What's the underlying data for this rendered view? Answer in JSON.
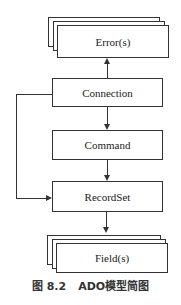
{
  "diagram": {
    "nodes": {
      "errors": {
        "label": "Error(s)",
        "stacked": true
      },
      "connection": {
        "label": "Connection"
      },
      "command": {
        "label": "Command"
      },
      "recordset": {
        "label": "RecordSet"
      },
      "fields": {
        "label": "Field(s)",
        "stacked": true
      }
    },
    "edges": [
      {
        "from": "Connection",
        "to": "Error(s)"
      },
      {
        "from": "Connection",
        "to": "Command"
      },
      {
        "from": "Command",
        "to": "RecordSet"
      },
      {
        "from": "Connection",
        "to": "RecordSet"
      },
      {
        "from": "RecordSet",
        "to": "Field(s)"
      }
    ]
  },
  "caption": {
    "figure_number": "图 8.2",
    "title": "ADO模型简图"
  }
}
